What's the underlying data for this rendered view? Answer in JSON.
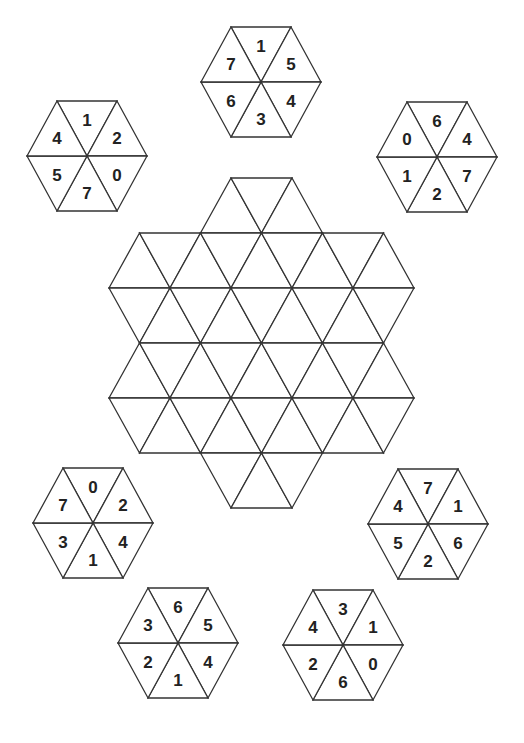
{
  "puzzle": {
    "style": {
      "background": "#ffffff",
      "line_color": "#333333",
      "digit_color": "#222222"
    },
    "tile_geometry": {
      "side": 60,
      "half_height": 55
    },
    "tiles": [
      {
        "id": "tile-top",
        "cx": 261,
        "cy": 82,
        "values": [
          "1",
          "5",
          "4",
          "3",
          "6",
          "7"
        ]
      },
      {
        "id": "tile-upper-left",
        "cx": 87,
        "cy": 156,
        "values": [
          "1",
          "2",
          "0",
          "7",
          "5",
          "4"
        ]
      },
      {
        "id": "tile-upper-right",
        "cx": 437,
        "cy": 157,
        "values": [
          "6",
          "4",
          "7",
          "2",
          "1",
          "0"
        ]
      },
      {
        "id": "tile-lower-left",
        "cx": 93,
        "cy": 523,
        "values": [
          "0",
          "2",
          "4",
          "1",
          "3",
          "7"
        ]
      },
      {
        "id": "tile-lower-right",
        "cx": 428,
        "cy": 524,
        "values": [
          "7",
          "1",
          "6",
          "2",
          "5",
          "4"
        ]
      },
      {
        "id": "tile-bottom-left",
        "cx": 178,
        "cy": 643,
        "values": [
          "6",
          "5",
          "4",
          "1",
          "2",
          "3"
        ]
      },
      {
        "id": "tile-bottom-right",
        "cx": 343,
        "cy": 645,
        "values": [
          "3",
          "1",
          "0",
          "6",
          "2",
          "4"
        ]
      }
    ],
    "board": {
      "x0": 109,
      "y0": 178,
      "step_x": 61,
      "step_y": 55,
      "rows": [
        {
          "y_index": 0,
          "half_offset": false,
          "cols": [
            2,
            3
          ]
        },
        {
          "y_index": 1,
          "half_offset": true,
          "cols": [
            0,
            1,
            2,
            3,
            4
          ]
        },
        {
          "y_index": 2,
          "half_offset": false,
          "cols": [
            0,
            1,
            2,
            3,
            4,
            5
          ]
        },
        {
          "y_index": 3,
          "half_offset": true,
          "cols": [
            0,
            1,
            2,
            3,
            4
          ]
        },
        {
          "y_index": 4,
          "half_offset": false,
          "cols": [
            0,
            1,
            2,
            3,
            4,
            5
          ]
        },
        {
          "y_index": 5,
          "half_offset": true,
          "cols": [
            0,
            1,
            2,
            3,
            4
          ]
        },
        {
          "y_index": 6,
          "half_offset": false,
          "cols": [
            2,
            3
          ]
        }
      ]
    }
  }
}
